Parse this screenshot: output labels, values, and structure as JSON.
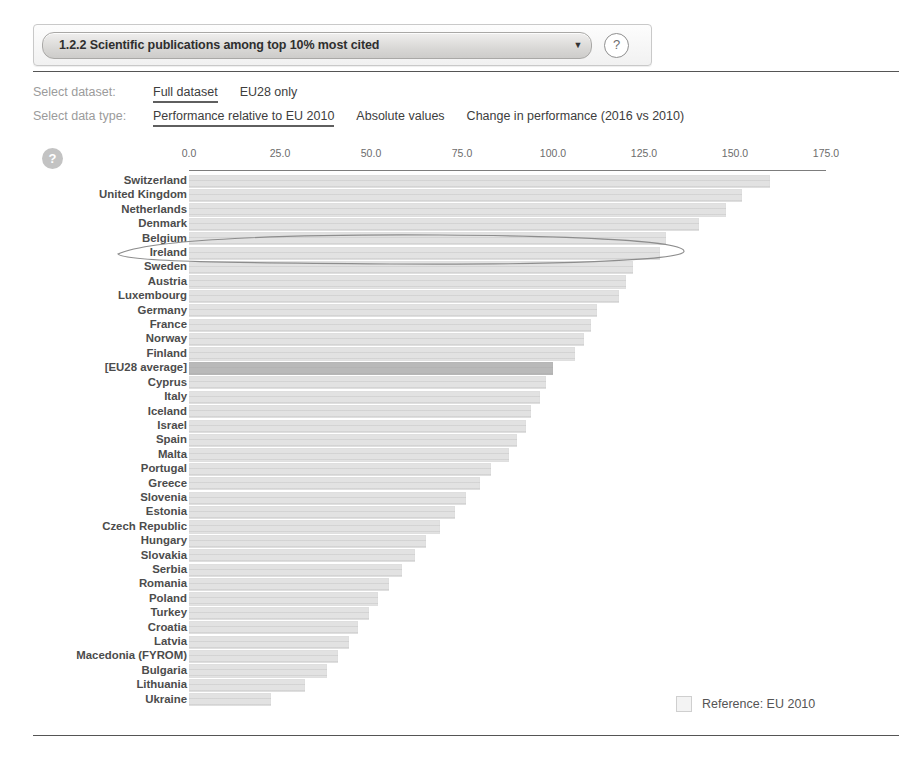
{
  "header": {
    "indicator_label": "1.2.2 Scientific publications among top 10% most cited",
    "caret_icon": "▼",
    "help_icon": "?"
  },
  "controls": {
    "dataset": {
      "caption": "Select dataset:",
      "options": [
        "Full dataset",
        "EU28 only"
      ],
      "selected": "Full dataset"
    },
    "datatype": {
      "caption": "Select data type:",
      "options": [
        "Performance relative to EU 2010",
        "Absolute values",
        "Change in performance (2016 vs 2010)"
      ],
      "selected": "Performance relative to EU 2010"
    }
  },
  "chart_help_icon": "?",
  "legend": {
    "text": "Reference: EU 2010"
  },
  "annotation": {
    "type": "hand-drawn-ellipse",
    "targets": [
      "Belgium",
      "Ireland"
    ]
  },
  "chart_data": {
    "type": "bar",
    "orientation": "horizontal",
    "title": "1.2.2 Scientific publications among top 10% most cited",
    "subtitle": "Performance relative to EU 2010",
    "xlabel": "",
    "ylabel": "",
    "xlim": [
      0.0,
      175.0
    ],
    "xticks": [
      0.0,
      25.0,
      50.0,
      75.0,
      100.0,
      125.0,
      150.0,
      175.0
    ],
    "xtick_labels": [
      "0.0",
      "25.0",
      "50.0",
      "75.0",
      "100.0",
      "125.0",
      "150.0",
      "175.0"
    ],
    "grid": false,
    "legend_position": "bottom-right",
    "reference_value": 100.0,
    "highlight_category": "[EU28 average]",
    "categories": [
      "Switzerland",
      "United Kingdom",
      "Netherlands",
      "Denmark",
      "Belgium",
      "Ireland",
      "Sweden",
      "Austria",
      "Luxembourg",
      "Germany",
      "France",
      "Norway",
      "Finland",
      "[EU28 average]",
      "Cyprus",
      "Italy",
      "Iceland",
      "Israel",
      "Spain",
      "Malta",
      "Portugal",
      "Greece",
      "Slovenia",
      "Estonia",
      "Czech Republic",
      "Hungary",
      "Slovakia",
      "Serbia",
      "Romania",
      "Poland",
      "Turkey",
      "Croatia",
      "Latvia",
      "Macedonia (FYROM)",
      "Bulgaria",
      "Lithuania",
      "Ukraine"
    ],
    "values": [
      159.5,
      152.0,
      147.5,
      140.0,
      131.0,
      129.5,
      122.0,
      120.0,
      118.0,
      112.0,
      110.5,
      108.5,
      106.0,
      100.0,
      98.0,
      96.5,
      94.0,
      92.5,
      90.0,
      88.0,
      83.0,
      80.0,
      76.0,
      73.0,
      69.0,
      65.0,
      62.0,
      58.5,
      55.0,
      52.0,
      49.5,
      46.5,
      44.0,
      41.0,
      38.0,
      32.0,
      22.5
    ]
  }
}
